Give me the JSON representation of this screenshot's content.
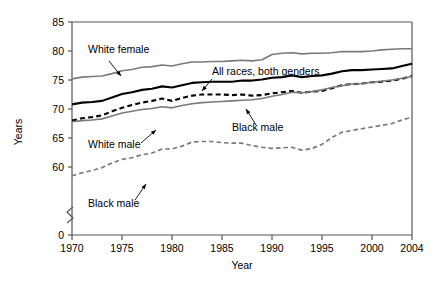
{
  "chart_data": {
    "type": "line",
    "title": "",
    "xlabel": "Year",
    "ylabel": "Years",
    "xlim": [
      1969,
      2004
    ],
    "ylim": [
      57,
      85
    ],
    "grid": false,
    "legend_position": "inline-annotations",
    "axis_break": true,
    "axis_break_note": "y-axis broken between 0 and ~57",
    "xticks": [
      1970,
      1975,
      1980,
      1985,
      1990,
      1995,
      2000,
      2004
    ],
    "xtick_labels": [
      "1970",
      "1975",
      "1980",
      "1985",
      "1990",
      "1995",
      "2000",
      "2004"
    ],
    "yticks": [
      0,
      60,
      65,
      70,
      75,
      80,
      85
    ],
    "ytick_labels": [
      "0",
      "60",
      "65",
      "70",
      "75",
      "80",
      "85"
    ],
    "x": [
      1970,
      1971,
      1972,
      1973,
      1974,
      1975,
      1976,
      1977,
      1978,
      1979,
      1980,
      1981,
      1982,
      1983,
      1984,
      1985,
      1986,
      1987,
      1988,
      1989,
      1990,
      1991,
      1992,
      1993,
      1994,
      1995,
      1996,
      1997,
      1998,
      1999,
      2000,
      2001,
      2002,
      2003,
      2004
    ],
    "series": [
      {
        "name": "White female",
        "label": "White female",
        "color": "#7a7a7a",
        "style": "solid",
        "width": 1.6,
        "values": [
          75.2,
          75.5,
          75.6,
          75.7,
          76.1,
          76.6,
          76.8,
          77.2,
          77.3,
          77.6,
          77.4,
          77.8,
          78.1,
          78.1,
          78.2,
          78.2,
          78.3,
          78.4,
          78.3,
          78.5,
          79.4,
          79.6,
          79.7,
          79.5,
          79.6,
          79.6,
          79.7,
          79.9,
          79.9,
          79.9,
          80.0,
          80.2,
          80.3,
          80.4,
          80.4
        ]
      },
      {
        "name": "All races, both genders",
        "label": "All races, both genders",
        "color": "#000000",
        "style": "solid",
        "width": 2.1,
        "values": [
          70.8,
          71.1,
          71.2,
          71.4,
          72.0,
          72.6,
          72.9,
          73.3,
          73.5,
          73.9,
          73.7,
          74.1,
          74.5,
          74.6,
          74.7,
          74.7,
          74.7,
          74.9,
          74.9,
          75.1,
          75.4,
          75.5,
          75.8,
          75.5,
          75.7,
          75.8,
          76.1,
          76.5,
          76.7,
          76.7,
          76.8,
          76.9,
          77.0,
          77.4,
          77.8
        ]
      },
      {
        "name": "Black male (upper dashed)",
        "label": "Black male",
        "color": "#000000",
        "style": "dashed",
        "width": 2.1,
        "values": [
          68.0,
          68.4,
          68.6,
          68.9,
          69.6,
          70.2,
          70.7,
          71.1,
          71.4,
          71.8,
          71.4,
          71.9,
          72.3,
          72.5,
          72.5,
          72.5,
          72.4,
          72.5,
          72.3,
          72.4,
          72.7,
          72.9,
          73.1,
          72.8,
          73.0,
          73.1,
          73.6,
          74.1,
          74.3,
          74.4,
          74.6,
          74.7,
          74.9,
          75.2,
          75.7
        ]
      },
      {
        "name": "White male",
        "label": "White male",
        "color": "#7a7a7a",
        "style": "solid",
        "width": 1.6,
        "values": [
          67.8,
          68.0,
          68.1,
          68.3,
          68.8,
          69.3,
          69.6,
          69.9,
          70.1,
          70.4,
          70.2,
          70.6,
          70.9,
          71.1,
          71.2,
          71.3,
          71.4,
          71.5,
          71.6,
          71.8,
          72.2,
          72.5,
          72.9,
          72.8,
          73.0,
          73.3,
          73.7,
          74.0,
          74.3,
          74.4,
          74.6,
          74.8,
          75.0,
          75.3,
          75.6
        ]
      },
      {
        "name": "Black male (lower dashed)",
        "label": "Black male",
        "color": "#7a7a7a",
        "style": "dashed",
        "width": 1.7,
        "values": [
          58.5,
          59.0,
          59.4,
          59.9,
          60.7,
          61.3,
          61.6,
          62.1,
          62.4,
          63.1,
          63.1,
          63.6,
          64.3,
          64.4,
          64.4,
          64.2,
          64.1,
          64.1,
          63.7,
          63.4,
          63.2,
          63.3,
          63.4,
          62.9,
          63.2,
          63.9,
          65.1,
          66.0,
          66.3,
          66.6,
          66.9,
          67.2,
          67.5,
          68.1,
          68.6
        ]
      }
    ],
    "annotations": [
      {
        "text": "White female",
        "x_px": 88,
        "y_px": 53,
        "leader_from": [
          109,
          61
        ],
        "leader_to": [
          121,
          76
        ]
      },
      {
        "text": "All races, both genders",
        "x_px": 212,
        "y_px": 75,
        "leader_from": [
          212,
          79
        ],
        "leader_to": [
          202,
          91
        ]
      },
      {
        "text": "Black male",
        "x_px": 232,
        "y_px": 131,
        "leader_from": [
          256,
          125
        ],
        "leader_to": [
          246,
          109
        ]
      },
      {
        "text": "White male",
        "x_px": 88,
        "y_px": 148,
        "leader_from": [
          141,
          143
        ],
        "leader_to": [
          156,
          130
        ]
      },
      {
        "text": "Black male",
        "x_px": 88,
        "y_px": 207,
        "leader_from": [
          135,
          200
        ],
        "leader_to": [
          146,
          184
        ]
      }
    ]
  }
}
